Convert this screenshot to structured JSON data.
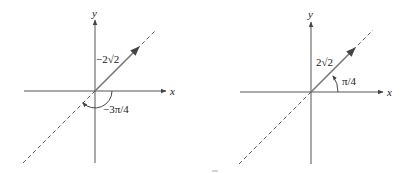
{
  "figures": [
    {
      "id": "left",
      "axis_labels": {
        "x": "x",
        "y": "y"
      },
      "magnitude_label": "−2√2",
      "angle_label": "−3π/4",
      "colors": {
        "axis": "#555555",
        "vector": "#666666",
        "dashed": "#555555"
      }
    },
    {
      "id": "right",
      "axis_labels": {
        "x": "x",
        "y": "y"
      },
      "magnitude_label": "2√2",
      "angle_label": "π/4",
      "colors": {
        "axis": "#555555",
        "vector": "#666666",
        "dashed": "#555555"
      }
    }
  ]
}
